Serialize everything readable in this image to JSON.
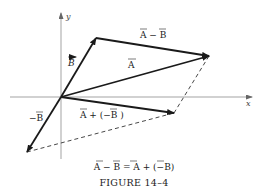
{
  "figure": {
    "title": "FIGURE 14–4",
    "caption_equation": "A − B = A + (−B)",
    "axes": {
      "x_label": "x",
      "y_label": "y"
    },
    "vectors": [
      {
        "name": "A",
        "label": "A",
        "from": [
          61,
          97
        ],
        "to": [
          209,
          56
        ],
        "style": "solid"
      },
      {
        "name": "B",
        "label": "B",
        "from": [
          61,
          97
        ],
        "to": [
          96,
          38
        ],
        "style": "solid"
      },
      {
        "name": "A-B",
        "label": "A − B",
        "from": [
          96,
          38
        ],
        "to": [
          209,
          56
        ],
        "style": "solid"
      },
      {
        "name": "-B",
        "label": "−B",
        "from": [
          61,
          97
        ],
        "to": [
          27,
          152
        ],
        "style": "solid"
      },
      {
        "name": "A+(-B)",
        "label": "A + (−B )",
        "from": [
          61,
          97
        ],
        "to": [
          174,
          113
        ],
        "style": "solid"
      }
    ],
    "dashed_lines": [
      {
        "from": [
          209,
          56
        ],
        "to": [
          174,
          113
        ]
      },
      {
        "from": [
          27,
          152
        ],
        "to": [
          174,
          113
        ]
      }
    ],
    "colors": {
      "vector": "#1a1a1a",
      "axis": "#999999",
      "dashed": "#333333"
    }
  }
}
